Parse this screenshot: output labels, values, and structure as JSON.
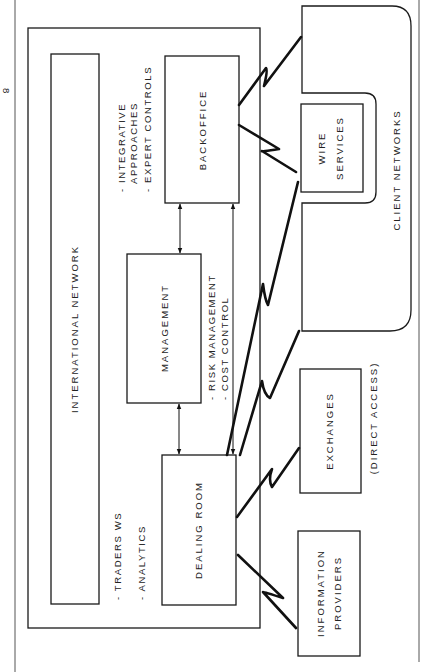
{
  "diagram": {
    "page_marker": "8",
    "international_network": {
      "label": "INTERNATIONAL NETWORK"
    },
    "nodes": {
      "backoffice": {
        "label": "BACKOFFICE"
      },
      "management": {
        "label": "MANAGEMENT"
      },
      "dealing_room": {
        "label": "DEALING ROOM"
      },
      "wire_services": {
        "line1": "WIRE",
        "line2": "SERVICES"
      },
      "exchanges": {
        "label": "EXCHANGES",
        "note": "(DIRECT ACCESS)"
      },
      "information_providers": {
        "line1": "INFORMATION",
        "line2": "PROVIDERS"
      },
      "client_networks": {
        "label": "CLIENT NETWORKS"
      }
    },
    "annotations": {
      "backoffice": [
        "- INTEGRATIVE",
        "  APPROACHES",
        "- EXPERT CONTROLS"
      ],
      "management": [
        "- RISK MANAGEMENT",
        "- COST CONTROL"
      ],
      "dealing_room": [
        "- TRADERS WS",
        "- ANALYTICS"
      ]
    },
    "connections": [
      {
        "from": "backoffice",
        "to": "client_networks",
        "type": "telecom-link"
      },
      {
        "from": "backoffice",
        "to": "wire_services",
        "type": "telecom-link"
      },
      {
        "from": "dealing_room",
        "to": "wire_services",
        "type": "telecom-link"
      },
      {
        "from": "dealing_room",
        "to": "client_networks",
        "type": "telecom-link"
      },
      {
        "from": "dealing_room",
        "to": "exchanges",
        "type": "telecom-link"
      },
      {
        "from": "dealing_room",
        "to": "information_providers",
        "type": "telecom-link"
      },
      {
        "from": "management",
        "to": "backoffice",
        "type": "bidirectional-arrow"
      },
      {
        "from": "management",
        "to": "dealing_room",
        "type": "bidirectional-arrow"
      },
      {
        "from": "dealing_room",
        "to": "backoffice",
        "type": "bidirectional-arrow"
      }
    ]
  }
}
